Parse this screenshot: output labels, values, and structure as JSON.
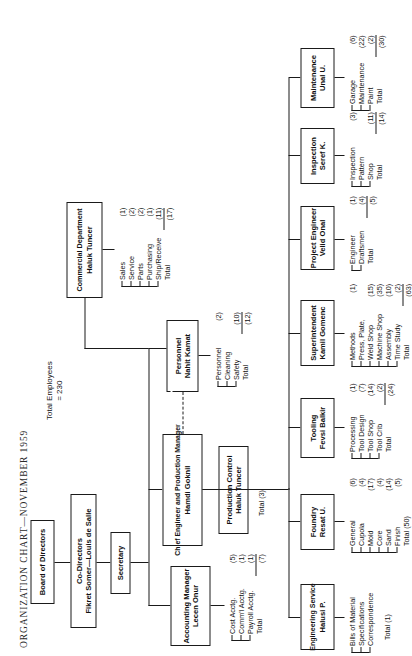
{
  "title": "ORGANIZATION CHART—NOVEMBER 1959",
  "total_employees": {
    "line1": "Total Employees",
    "line2": "= 230"
  },
  "nodes": {
    "board": {
      "line1": "Board of Directors"
    },
    "codirectors": {
      "line1": "Co-Directors",
      "line2": "Fikret Somer—Louis de Salle"
    },
    "secretary": {
      "line1": "Secretary"
    },
    "chief_engineer": {
      "line1": "Chief Engineer and Production Manager",
      "line2": "Hamdi Goknil"
    },
    "accounting": {
      "line1": "Accounting Manager",
      "line2": "Lecen Onur"
    },
    "commercial": {
      "line1": "Commercial Department",
      "line2": "Haluk Tuncer"
    },
    "personnel": {
      "line1": "Personnel",
      "line2": "Nahit Kamat"
    },
    "production_control": {
      "line1": "Production Control",
      "line2": "Haluk Tuncer"
    },
    "engineering_service": {
      "line1": "Engineering Service",
      "line2": "Halusi P."
    },
    "foundry": {
      "line1": "Foundry",
      "line2": "Resat U."
    },
    "tooling": {
      "line1": "Tooling",
      "line2": "Fevsi Balkir"
    },
    "superintendent": {
      "line1": "Superintendent",
      "line2": "Kamil Gomenc"
    },
    "project_engineer": {
      "line1": "Project Engineer",
      "line2": "Velid Onal"
    },
    "inspection": {
      "line1": "Inspection",
      "line2": "Seref K."
    },
    "maintenance": {
      "line1": "Maintenance",
      "line2": "Unal U."
    }
  },
  "leaves": {
    "accounting": [
      {
        "label": "Cost Acctg.",
        "count": "(5)"
      },
      {
        "label": "Comm'l Acctg.",
        "count": "(1)"
      },
      {
        "label": "Payroll Acctg.",
        "count": "(1)"
      },
      {
        "label": "Total",
        "count": "(7)",
        "total": true
      }
    ],
    "commercial": [
      {
        "label": "Sales",
        "count": "(1)"
      },
      {
        "label": "Service",
        "count": "(2)"
      },
      {
        "label": "Parts",
        "count": "(2)"
      },
      {
        "label": "Purchasing",
        "count": "(1)"
      },
      {
        "label": "Ship/Receive",
        "count": "(11)"
      },
      {
        "label": "Total",
        "count": "(17)",
        "total": true
      }
    ],
    "personnel": [
      {
        "label": "Personnel",
        "count": "(2)"
      },
      {
        "label": "Cleaning",
        "count": ""
      },
      {
        "label": "Safety",
        "count": "(10)"
      },
      {
        "label": "Total",
        "count": "(12)",
        "total": true
      }
    ],
    "engineering_service": [
      {
        "label": "Bills of Material",
        "count": ""
      },
      {
        "label": "Specifications",
        "count": ""
      },
      {
        "label": "Correspondence",
        "count": ""
      }
    ],
    "foundry": [
      {
        "label": "General",
        "count": "(6)"
      },
      {
        "label": "Cupola",
        "count": "(4)"
      },
      {
        "label": "Mold",
        "count": "(17)"
      },
      {
        "label": "Core",
        "count": "(4)"
      },
      {
        "label": "Sand",
        "count": "(14)"
      },
      {
        "label": "Finish",
        "count": "(5)"
      },
      {
        "label": "Total (50)",
        "count": "",
        "total": true
      }
    ],
    "tooling": [
      {
        "label": "Processing",
        "count": "(1)"
      },
      {
        "label": "Tool Design",
        "count": "(7)"
      },
      {
        "label": "Tool Shop",
        "count": "(14)"
      },
      {
        "label": "Tool Crib",
        "count": "(2)"
      },
      {
        "label": "Total",
        "count": "(24)",
        "total": true
      }
    ],
    "superintendent": [
      {
        "label": "Methods",
        "count": "(1)"
      },
      {
        "label": "Press, Plate,",
        "count": ""
      },
      {
        "label": "Weld Shop",
        "count": "(15)"
      },
      {
        "label": "Machine Shop",
        "count": "(35)"
      },
      {
        "label": "Assembly",
        "count": "(10)"
      },
      {
        "label": "Time Study",
        "count": "(2)"
      },
      {
        "label": "Total",
        "count": "(63)",
        "total": true
      }
    ],
    "project_engineer": [
      {
        "label": "Engineer",
        "count": "(1)"
      },
      {
        "label": "Draftsmen",
        "count": "(4)"
      },
      {
        "label": "Total",
        "count": "(5)",
        "total": true
      }
    ],
    "inspection": [
      {
        "label": "Inspection",
        "count": "(3)"
      },
      {
        "label": "Pattern",
        "count": ""
      },
      {
        "label": "Shop",
        "count": "(11)"
      },
      {
        "label": "Total",
        "count": "(14)",
        "total": true
      }
    ],
    "maintenance": [
      {
        "label": "Garage",
        "count": "(6)"
      },
      {
        "label": "Maintenance",
        "count": "(22)"
      },
      {
        "label": "Paint",
        "count": "(2)"
      },
      {
        "label": "Total",
        "count": "(30)",
        "total": true
      }
    ]
  },
  "inline_totals": {
    "production_control": "Total (3)",
    "engineering_service": "Total (1)"
  }
}
